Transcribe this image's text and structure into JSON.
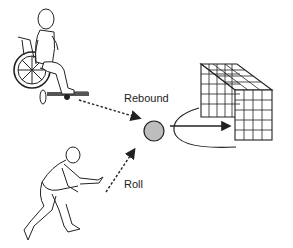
{
  "diagram": {
    "labels": {
      "rebound": "Rebound",
      "roll": "Roll"
    },
    "elements": [
      {
        "id": "wheelchair-player",
        "description": "person seated in wheelchair"
      },
      {
        "id": "rolling-player",
        "description": "crouching person rolling ball"
      },
      {
        "id": "ball",
        "description": "grey ball"
      },
      {
        "id": "goal-net",
        "description": "mesh goal box"
      }
    ],
    "arrows": [
      {
        "from": "wheelchair-player",
        "to": "ball",
        "style": "dashed",
        "label": "Rebound"
      },
      {
        "from": "rolling-player",
        "to": "ball",
        "style": "dashed",
        "label": "Roll"
      },
      {
        "from": "ball",
        "to": "goal-net",
        "style": "solid",
        "curve": "loop around"
      }
    ],
    "colors": {
      "ball_fill": "#bdbdbd",
      "stroke": "#222222"
    }
  }
}
